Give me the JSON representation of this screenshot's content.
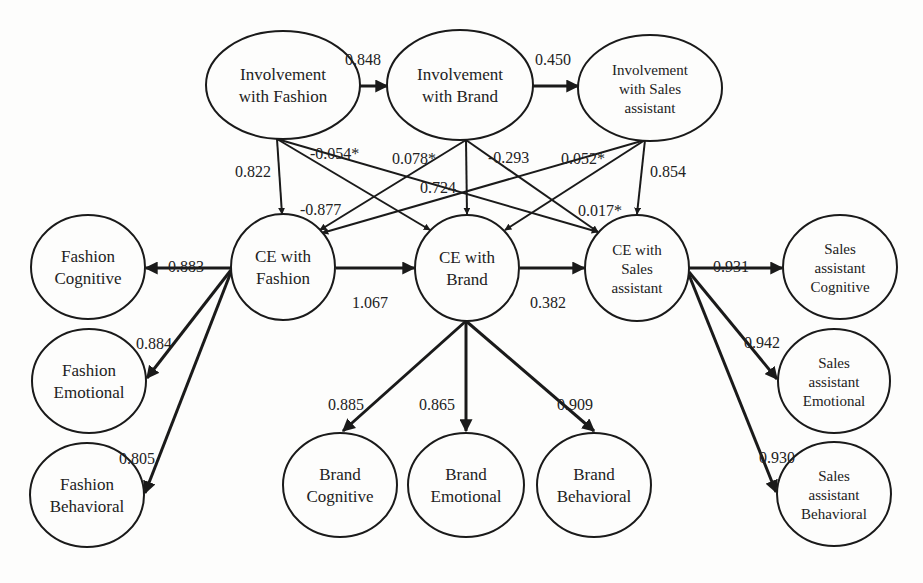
{
  "diagram": {
    "type": "structural-equation-model",
    "nodes": [
      {
        "id": "inv_fashion",
        "lines": [
          "Involvement",
          "with Fashion"
        ],
        "cx": 283,
        "cy": 85,
        "rx": 77,
        "ry": 54
      },
      {
        "id": "inv_brand",
        "lines": [
          "Involvement",
          "with Brand"
        ],
        "cx": 460,
        "cy": 85,
        "rx": 73,
        "ry": 55
      },
      {
        "id": "inv_sales",
        "lines": [
          "Involvement",
          "with Sales",
          "assistant"
        ],
        "cx": 650,
        "cy": 88,
        "rx": 72,
        "ry": 53
      },
      {
        "id": "ce_fashion",
        "lines": [
          "CE with",
          "Fashion"
        ],
        "cx": 283,
        "cy": 267,
        "rx": 52,
        "ry": 53
      },
      {
        "id": "ce_brand",
        "lines": [
          "CE with",
          "Brand"
        ],
        "cx": 467,
        "cy": 268,
        "rx": 52,
        "ry": 53
      },
      {
        "id": "ce_sales",
        "lines": [
          "CE with",
          "Sales",
          "assistant"
        ],
        "cx": 637,
        "cy": 268,
        "rx": 52,
        "ry": 53
      },
      {
        "id": "fashion_cog",
        "lines": [
          "Fashion",
          "Cognitive"
        ],
        "cx": 88,
        "cy": 267,
        "rx": 57,
        "ry": 52
      },
      {
        "id": "fashion_emo",
        "lines": [
          "Fashion",
          "Emotional"
        ],
        "cx": 89,
        "cy": 381,
        "rx": 57,
        "ry": 52
      },
      {
        "id": "fashion_beh",
        "lines": [
          "Fashion",
          "Behavioral"
        ],
        "cx": 87,
        "cy": 495,
        "rx": 57,
        "ry": 52
      },
      {
        "id": "brand_cog",
        "lines": [
          "Brand",
          "Cognitive"
        ],
        "cx": 340,
        "cy": 485,
        "rx": 57,
        "ry": 52
      },
      {
        "id": "brand_emo",
        "lines": [
          "Brand",
          "Emotional"
        ],
        "cx": 466,
        "cy": 485,
        "rx": 58,
        "ry": 52
      },
      {
        "id": "brand_beh",
        "lines": [
          "Brand",
          "Behavioral"
        ],
        "cx": 594,
        "cy": 485,
        "rx": 57,
        "ry": 52
      },
      {
        "id": "sales_cog",
        "lines": [
          "Sales",
          "assistant",
          "Cognitive"
        ],
        "cx": 840,
        "cy": 267,
        "rx": 57,
        "ry": 52
      },
      {
        "id": "sales_emo",
        "lines": [
          "Sales",
          "assistant",
          "Emotional"
        ],
        "cx": 834,
        "cy": 381,
        "rx": 56,
        "ry": 52
      },
      {
        "id": "sales_beh",
        "lines": [
          "Sales",
          "assistant",
          "Behavioral"
        ],
        "cx": 834,
        "cy": 494,
        "rx": 57,
        "ry": 52
      }
    ],
    "edges": [
      {
        "from": "inv_fashion",
        "to": "inv_brand",
        "label": "0.848",
        "x1": 360,
        "y1": 86,
        "x2": 387,
        "y2": 86,
        "thick": true,
        "lx": 345,
        "ly": 53
      },
      {
        "from": "inv_brand",
        "to": "inv_sales",
        "label": "0.450",
        "x1": 533,
        "y1": 86,
        "x2": 578,
        "y2": 86,
        "thick": true,
        "lx": 535,
        "ly": 53
      },
      {
        "from": "inv_fashion",
        "to": "ce_fashion",
        "label": "0.822",
        "x1": 277,
        "y1": 139,
        "x2": 282,
        "y2": 214,
        "thick": false,
        "lx": 235,
        "ly": 165
      },
      {
        "from": "inv_fashion",
        "to": "ce_brand",
        "label": "-0.877",
        "x1": 277,
        "y1": 139,
        "x2": 430,
        "y2": 230,
        "thick": false,
        "lx": 300,
        "ly": 203
      },
      {
        "from": "inv_fashion",
        "to": "ce_sales",
        "label": "-0.054*",
        "x1": 277,
        "y1": 139,
        "x2": 598,
        "y2": 232,
        "thick": false,
        "lx": 310,
        "ly": 147
      },
      {
        "from": "inv_brand",
        "to": "ce_fashion",
        "label": "0.078*",
        "x1": 466,
        "y1": 140,
        "x2": 320,
        "y2": 230,
        "thick": false,
        "lx": 392,
        "ly": 152
      },
      {
        "from": "inv_brand",
        "to": "ce_brand",
        "label": "0.724",
        "x1": 466,
        "y1": 140,
        "x2": 467,
        "y2": 214,
        "thick": false,
        "lx": 420,
        "ly": 181
      },
      {
        "from": "inv_brand",
        "to": "ce_sales",
        "label": "-0.293",
        "x1": 466,
        "y1": 140,
        "x2": 598,
        "y2": 232,
        "thick": false,
        "lx": 488,
        "ly": 151
      },
      {
        "from": "inv_sales",
        "to": "ce_fashion",
        "label": "0.052*",
        "x1": 645,
        "y1": 140,
        "x2": 322,
        "y2": 233,
        "thick": false,
        "lx": 561,
        "ly": 152
      },
      {
        "from": "inv_sales",
        "to": "ce_brand",
        "label": "0.017*",
        "x1": 645,
        "y1": 140,
        "x2": 505,
        "y2": 230,
        "thick": false,
        "lx": 578,
        "ly": 204
      },
      {
        "from": "inv_sales",
        "to": "ce_sales",
        "label": "0.854",
        "x1": 645,
        "y1": 140,
        "x2": 637,
        "y2": 214,
        "thick": false,
        "lx": 650,
        "ly": 165
      },
      {
        "from": "ce_fashion",
        "to": "ce_brand",
        "label": "1.067",
        "x1": 336,
        "y1": 268,
        "x2": 414,
        "y2": 268,
        "thick": true,
        "lx": 352,
        "ly": 296
      },
      {
        "from": "ce_brand",
        "to": "ce_sales",
        "label": "0.382",
        "x1": 520,
        "y1": 268,
        "x2": 584,
        "y2": 268,
        "thick": true,
        "lx": 530,
        "ly": 296
      },
      {
        "from": "ce_fashion",
        "to": "fashion_cog",
        "label": "0.883",
        "x1": 231,
        "y1": 268,
        "x2": 146,
        "y2": 268,
        "thick": true,
        "lx": 168,
        "ly": 260
      },
      {
        "from": "ce_fashion",
        "to": "fashion_emo",
        "label": "0.884",
        "x1": 231,
        "y1": 270,
        "x2": 147,
        "y2": 378,
        "thick": true,
        "lx": 136,
        "ly": 337
      },
      {
        "from": "ce_fashion",
        "to": "fashion_beh",
        "label": "0.805",
        "x1": 231,
        "y1": 272,
        "x2": 145,
        "y2": 493,
        "thick": true,
        "lx": 119,
        "ly": 452
      },
      {
        "from": "ce_brand",
        "to": "brand_cog",
        "label": "0.885",
        "x1": 466,
        "y1": 321,
        "x2": 343,
        "y2": 431,
        "thick": true,
        "lx": 328,
        "ly": 398
      },
      {
        "from": "ce_brand",
        "to": "brand_emo",
        "label": "0.865",
        "x1": 466,
        "y1": 321,
        "x2": 466,
        "y2": 431,
        "thick": true,
        "lx": 419,
        "ly": 398
      },
      {
        "from": "ce_brand",
        "to": "brand_beh",
        "label": "0.909",
        "x1": 466,
        "y1": 321,
        "x2": 594,
        "y2": 431,
        "thick": true,
        "lx": 557,
        "ly": 398
      },
      {
        "from": "ce_sales",
        "to": "sales_cog",
        "label": "0.931",
        "x1": 689,
        "y1": 268,
        "x2": 782,
        "y2": 268,
        "thick": true,
        "lx": 713,
        "ly": 260
      },
      {
        "from": "ce_sales",
        "to": "sales_emo",
        "label": "0.942",
        "x1": 689,
        "y1": 272,
        "x2": 777,
        "y2": 379,
        "thick": true,
        "lx": 744,
        "ly": 336
      },
      {
        "from": "ce_sales",
        "to": "sales_beh",
        "label": "0.930",
        "x1": 689,
        "y1": 275,
        "x2": 776,
        "y2": 492,
        "thick": true,
        "lx": 759,
        "ly": 451
      }
    ]
  }
}
